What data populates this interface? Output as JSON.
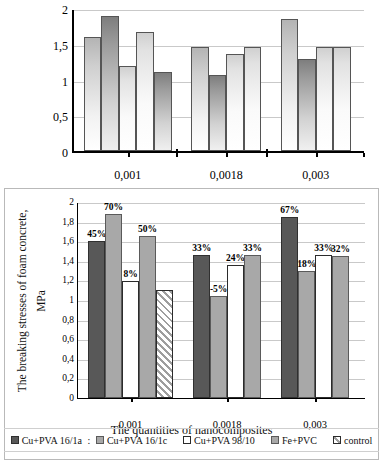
{
  "chart_data": [
    {
      "type": "bar",
      "id": "top-chart",
      "title": "",
      "xlabel": "",
      "ylabel": "",
      "ylim": [
        0,
        2
      ],
      "yticks": [
        "0",
        "0,5",
        "1",
        "1,5",
        "2"
      ],
      "ytickvals": [
        0,
        0.5,
        1,
        1.5,
        2
      ],
      "grid": true,
      "categories": [
        "0,001",
        "0,0018",
        "0,003"
      ],
      "groups": [
        {
          "category": "0,001",
          "values": [
            1.59,
            1.89,
            1.19,
            1.67,
            1.11
          ]
        },
        {
          "category": "0,0018",
          "values": [
            1.46,
            1.06,
            1.36,
            1.46
          ]
        },
        {
          "category": "0,003",
          "values": [
            1.85,
            1.29,
            1.46,
            1.45
          ]
        }
      ]
    },
    {
      "type": "bar",
      "id": "bottom-chart",
      "title": "",
      "xlabel": "The quantities of nanocomposites",
      "ylabel_line1": "The breaking stresses of foam concrete,",
      "ylabel_line2": "MPa",
      "ylim": [
        0,
        2
      ],
      "yticks": [
        "0",
        "0,2",
        "0,4",
        "0,6",
        "0,8",
        "1",
        "1,2",
        "1,4",
        "1,6",
        "1,8",
        "2"
      ],
      "ytickvals": [
        0,
        0.2,
        0.4,
        0.6,
        0.8,
        1,
        1.2,
        1.4,
        1.6,
        1.8,
        2
      ],
      "grid": true,
      "categories": [
        "0,001",
        "0,0018",
        "0,003"
      ],
      "series_names": [
        "Cu+PVA 16/1a",
        "Cu+PVA 16/1c",
        "Cu+PVA 98/10",
        "Fe+PVC",
        "control"
      ],
      "groups": [
        {
          "category": "0,001",
          "bars": [
            {
              "series": "Cu+PVA 16/1a",
              "value": 1.6,
              "label": "45%"
            },
            {
              "series": "Cu+PVA 16/1c",
              "value": 1.88,
              "label": "70%"
            },
            {
              "series": "Cu+PVA 98/10",
              "value": 1.19,
              "label": "8%"
            },
            {
              "series": "Fe+PVC",
              "value": 1.65,
              "label": "50%"
            },
            {
              "series": "control",
              "value": 1.1,
              "label": ""
            }
          ]
        },
        {
          "category": "0,0018",
          "bars": [
            {
              "series": "Cu+PVA 16/1a",
              "value": 1.46,
              "label": "33%"
            },
            {
              "series": "Cu+PVA 16/1c",
              "value": 1.04,
              "label": "-5%"
            },
            {
              "series": "Cu+PVA 98/10",
              "value": 1.36,
              "label": "24%"
            },
            {
              "series": "Fe+PVC",
              "value": 1.46,
              "label": "33%"
            }
          ]
        },
        {
          "category": "0,003",
          "bars": [
            {
              "series": "Cu+PVA 16/1a",
              "value": 1.85,
              "label": "67%"
            },
            {
              "series": "Cu+PVA 16/1c",
              "value": 1.3,
              "label": "18%"
            },
            {
              "series": "Cu+PVA 98/10",
              "value": 1.46,
              "label": "33%"
            },
            {
              "series": "Fe+PVC",
              "value": 1.45,
              "label": "32%"
            }
          ]
        }
      ],
      "legend": {
        "position": "bottom",
        "separator": ":",
        "entries": [
          {
            "label": "Cu+PVA 16/1a",
            "swatch": "solid-dark"
          },
          {
            "label": "Cu+PVA 16/1c",
            "swatch": "solid-gray"
          },
          {
            "label": "Cu+PVA 98/10",
            "swatch": "outline-white"
          },
          {
            "label": "Fe+PVC",
            "swatch": "solid-gray"
          },
          {
            "label": "control",
            "swatch": "hatched"
          }
        ]
      }
    }
  ],
  "top": {
    "ticks": [
      "2",
      "1,5",
      "1",
      "0,5",
      "0"
    ],
    "cats": [
      "0,001",
      "0,0018",
      "0,003"
    ]
  },
  "bottom": {
    "ticks": [
      "2",
      "1,8",
      "1,6",
      "1,4",
      "1,2",
      "1",
      "0,8",
      "0,6",
      "0,4",
      "0,2",
      "0"
    ],
    "cats": [
      "0,001",
      "0,0018",
      "0,003"
    ],
    "ylabel_line1": "The breaking stresses of foam concrete,",
    "ylabel_line2": "MPa",
    "xlabel": "The quantities of nanocomposites",
    "pct": {
      "g1": [
        "45%",
        "70%",
        "8%",
        "50%",
        ""
      ],
      "g2": [
        "33%",
        "-5%",
        "24%",
        "33%"
      ],
      "g3": [
        "67%",
        "18%",
        "33%",
        "32%"
      ]
    },
    "legend": {
      "e0": "Cu+PVA 16/1a",
      "sep": ":",
      "e1": "Cu+PVA 16/1c",
      "e2": "Cu+PVA 98/10",
      "e3": "Fe+PVC",
      "e4": "control"
    }
  }
}
